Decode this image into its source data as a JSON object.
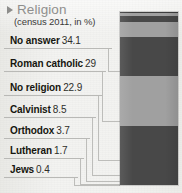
{
  "header": {
    "bullet_icon": "triangle-right-icon",
    "title": "Religion",
    "subtitle": "(census 2011, in %)"
  },
  "colors": {
    "background": "#f2f2f0",
    "title": "#8f8f8d",
    "text": "#16160f",
    "rule": "#b9b9b6",
    "band_dark": "#484848",
    "band_light": "#a0a0a0",
    "leader": "#bdbdba"
  },
  "rows": [
    {
      "name": "No answer",
      "value": "34.1"
    },
    {
      "name": "Roman catholic",
      "value": "29"
    },
    {
      "name": "No religion",
      "value": "22.9"
    },
    {
      "name": "Calvinist",
      "value": "8.5"
    },
    {
      "name": "Orthodox",
      "value": "3.7"
    },
    {
      "name": "Lutheran",
      "value": "1.7"
    },
    {
      "name": "Jews",
      "value": "0.4"
    }
  ],
  "chart_data": {
    "type": "bar",
    "title": "Religion",
    "subtitle": "(census 2011, in %)",
    "orientation": "vertical-stacked",
    "xlabel": "",
    "ylabel": "share of population (%)",
    "ylim": [
      0,
      100.3
    ],
    "grid": false,
    "legend": "labels-left-with-leader-lines",
    "categories": [
      "No answer",
      "Roman catholic",
      "No religion",
      "Calvinist",
      "Orthodox",
      "Lutheran",
      "Jews"
    ],
    "values": [
      34.1,
      29,
      22.9,
      8.5,
      3.7,
      1.7,
      0.4
    ],
    "units": "%",
    "total": 100.3,
    "segment_colors": [
      "#484848",
      "#a0a0a0",
      "#484848",
      "#a0a0a0",
      "#484848",
      "#a0a0a0",
      "#3e3e3e"
    ]
  }
}
